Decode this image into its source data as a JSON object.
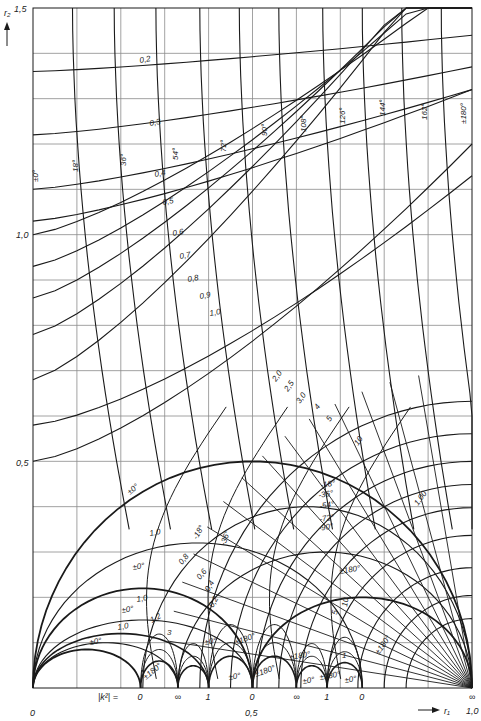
{
  "chart_data": {
    "type": "line",
    "title": "",
    "xlabel": "r1",
    "ylabel": "r2",
    "xlim": [
      0,
      1.0
    ],
    "ylim": [
      0,
      1.5
    ],
    "grid": true,
    "grid_step_x": 0.1,
    "grid_step_y": 0.1,
    "x_ticks": [
      {
        "value": 0,
        "label": "0"
      },
      {
        "value": 0.5,
        "label": "0,5"
      },
      {
        "value": 1.0,
        "label": "1,0"
      }
    ],
    "y_ticks": [
      {
        "value": 0.5,
        "label": "0,5"
      },
      {
        "value": 1.0,
        "label": "1,0"
      },
      {
        "value": 1.5,
        "label": "1,5"
      }
    ],
    "baseline_label": "|k²| =",
    "baseline_marks": [
      {
        "r1": 0.245,
        "label": "0"
      },
      {
        "r1": 0.33,
        "label": "∞"
      },
      {
        "r1": 0.4,
        "label": "1"
      },
      {
        "r1": 0.5,
        "label": "0"
      },
      {
        "r1": 0.6,
        "label": "∞"
      },
      {
        "r1": 0.67,
        "label": "1"
      },
      {
        "r1": 0.75,
        "label": "0"
      },
      {
        "r1": 1.0,
        "label": "∞"
      }
    ],
    "magnitude_contours_upper": [
      {
        "label": "0,2",
        "r2_at_left": 1.36
      },
      {
        "label": "0,3",
        "r2_at_left": 1.22
      },
      {
        "label": "0,4",
        "r2_at_left": 1.1
      },
      {
        "label": "0,5",
        "r2_at_left": 1.03
      },
      {
        "label": "0,6",
        "r2_at_left": 1.0
      },
      {
        "label": "0,7",
        "r2_at_left": 0.93
      },
      {
        "label": "0,8",
        "r2_at_left": 0.86
      },
      {
        "label": "0,9",
        "r2_at_left": 0.78
      },
      {
        "label": "1,0",
        "r2_at_left": 0.68
      }
    ],
    "magnitude_contours_converging": [
      "2,0",
      "2,5",
      "3,0",
      "4",
      "5",
      "10",
      "100"
    ],
    "angle_contours_upper": [
      "±0°",
      "18°",
      "36°",
      "54°",
      "72°",
      "90°",
      "108°",
      "126°",
      "144°",
      "162°",
      "±180°"
    ],
    "angle_contours_lower": [
      "-18°",
      "-36°",
      "-54°",
      "-72°",
      "-90°",
      "±180°"
    ],
    "lower_region_labels": [
      "±0°",
      "1,0",
      "±0°",
      "1,0",
      "±0°",
      "1,0",
      "±0°",
      "1,2",
      "3",
      "0,8",
      "0,6",
      "0,4",
      "0,2",
      "-18°",
      "-36°",
      "±180°",
      "±180°",
      "±180°",
      "±0°",
      "±180°",
      "±0°",
      "±0°",
      "±180°",
      "5",
      "10",
      "1",
      "±0°",
      "±180°"
    ]
  },
  "axes": {
    "y_axis_label": "r₂",
    "x_axis_label": "r₁",
    "origin_label": "0",
    "x_mid_label": "0,5",
    "x_end_label": "1,0",
    "y_top_label": "1,5",
    "y_mid_label": "1,0",
    "y_low_label": "0,5",
    "k_label": "|k²|  =",
    "marks": [
      "0",
      "∞",
      "1",
      "0",
      "∞",
      "1",
      "0",
      "∞"
    ]
  },
  "labels": {
    "mag": [
      "0,2",
      "0,3",
      "0,4",
      "0,5",
      "0,6",
      "0,7",
      "0,8",
      "0,9",
      "1,0"
    ],
    "mag_hi": [
      "2,0",
      "2,5",
      "3,0",
      "4",
      "5",
      "10",
      "1,00"
    ],
    "ang": [
      "±0°",
      "18°",
      "36°",
      "54°",
      "72°",
      "90°",
      "108°",
      "126°",
      "144°",
      "162°",
      "±180°"
    ],
    "neg": [
      "-18°",
      "-36°",
      "-54°",
      "-72°",
      "-90°",
      "±180°"
    ],
    "low": {
      "a0": "±0°",
      "a1": "1,0",
      "a2": "±0°",
      "a3": "1,0",
      "a4": "±0°",
      "a5": "1,0",
      "a6": "±0°",
      "b1": "1,2",
      "b2": "3",
      "c1": "0,8",
      "c2": "0,6",
      "c3": "0,4",
      "c4": "0,2",
      "d1": "-18°",
      "d2": "-36°",
      "e1": "±180°",
      "e2": "±180°",
      "e3": "±180°",
      "e4": "±0°",
      "e5": "±180°",
      "e6": "±0°",
      "e7": "±0°",
      "e8": "±180°",
      "f1": "5",
      "f2": "10",
      "f3": "1",
      "f4": "±0°",
      "f5": "±180°"
    }
  },
  "colors": {
    "ink": "#1a1a1a",
    "grid": "#8a8a8a",
    "bg": "#ffffff"
  }
}
